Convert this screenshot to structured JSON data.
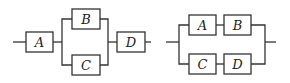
{
  "diagrams": [
    {
      "name": "circuit-1",
      "description": "A in series with (B parallel C), then in series with D",
      "components": [
        {
          "label": "A"
        },
        {
          "label": "B"
        },
        {
          "label": "C"
        },
        {
          "label": "D"
        }
      ]
    },
    {
      "name": "circuit-2",
      "description": "(A series B) in parallel with (C series D)",
      "components": [
        {
          "label": "A"
        },
        {
          "label": "B"
        },
        {
          "label": "C"
        },
        {
          "label": "D"
        }
      ]
    }
  ],
  "colors": {
    "line": "#333333",
    "background": "#ffffff"
  }
}
